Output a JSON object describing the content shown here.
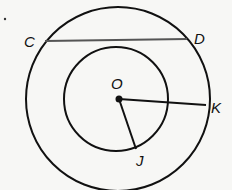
{
  "diagram": {
    "type": "concentric-circles",
    "colors": {
      "stroke": "#111111",
      "chord": "#555555",
      "background": "#f7f7f5"
    },
    "center": {
      "label": "O",
      "x": 118,
      "y": 99
    },
    "outer_circle": {
      "cx": 118,
      "cy": 99,
      "r": 92
    },
    "inner_circle": {
      "cx": 116,
      "cy": 99,
      "r": 52
    },
    "chord": {
      "from": "C",
      "to": "D"
    },
    "segments": [
      {
        "from": "O",
        "to": "K"
      },
      {
        "from": "O",
        "to": "J"
      }
    ],
    "points": {
      "C": {
        "label": "C"
      },
      "D": {
        "label": "D"
      },
      "K": {
        "label": "K"
      },
      "J": {
        "label": "J"
      },
      "O": {
        "label": "O"
      }
    },
    "bullet": "."
  }
}
